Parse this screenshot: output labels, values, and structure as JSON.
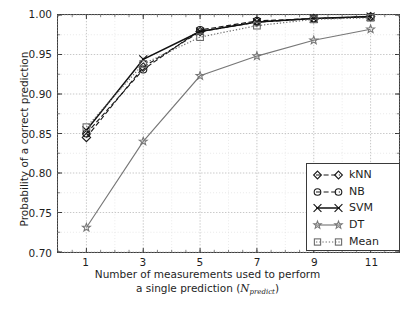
{
  "chart_data": {
    "type": "line",
    "title": "",
    "xlabel": "Number of measurements used to perform a single prediction (N_predict)",
    "xlabel_line1": "Number of measurements used to perform",
    "xlabel_line2_prefix": "a single prediction (",
    "xlabel_line2_symbol": "N",
    "xlabel_line2_subscript": "predict",
    "xlabel_line2_suffix": ")",
    "ylabel": "Probability of a correct prediction",
    "x": [
      1,
      3,
      5,
      7,
      9,
      11
    ],
    "xticklabels": [
      "1",
      "3",
      "5",
      "7",
      "9",
      "11"
    ],
    "yticklabels": [
      "0.70",
      "0.75",
      "0.80",
      "0.85",
      "0.90",
      "0.95",
      "1.00"
    ],
    "ytickvalues": [
      0.7,
      0.75,
      0.8,
      0.85,
      0.9,
      0.95,
      1.0
    ],
    "xlim": [
      0,
      12
    ],
    "ylim": [
      0.7,
      1.0
    ],
    "grid": true,
    "grid_minor_step": 0.025,
    "legend_position": "lower right",
    "series": [
      {
        "name": "kNN",
        "marker": "diamond",
        "linestyle": "dashed",
        "color": "#1a1a1a",
        "values": [
          0.845,
          0.934,
          0.979,
          0.991,
          0.9955,
          0.998
        ]
      },
      {
        "name": "NB",
        "marker": "circle",
        "linestyle": "dashed",
        "color": "#1a1a1a",
        "values": [
          0.85,
          0.931,
          0.981,
          0.9925,
          0.9955,
          0.9975
        ]
      },
      {
        "name": "SVM",
        "marker": "x",
        "linestyle": "solid",
        "color": "#111111",
        "values": [
          0.854,
          0.944,
          0.979,
          0.991,
          0.9955,
          0.998
        ]
      },
      {
        "name": "DT",
        "marker": "star",
        "linestyle": "solid",
        "color": "#777777",
        "values": [
          0.731,
          0.84,
          0.923,
          0.948,
          0.968,
          0.982
        ]
      },
      {
        "name": "Mean",
        "marker": "square",
        "linestyle": "dotted",
        "color": "#6b6b6b",
        "values": [
          0.858,
          0.938,
          0.972,
          0.9865,
          0.9945,
          0.9965
        ]
      }
    ]
  }
}
